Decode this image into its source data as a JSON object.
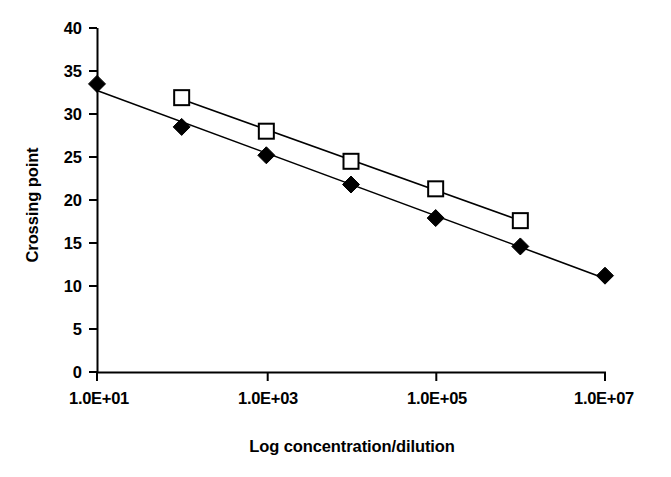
{
  "chart_data": {
    "type": "scatter",
    "title": "",
    "subtitle": "",
    "xlabel": "Log concentration/dilution",
    "ylabel": "Crossing point",
    "xscale": "log",
    "xlim": [
      10,
      10000000
    ],
    "ylim": [
      0,
      40
    ],
    "grid": false,
    "legend": "none",
    "x_tick_labels": [
      "1.0E+01",
      "1.0E+03",
      "1.0E+05",
      "1.0E+07"
    ],
    "x_tick_values": [
      10,
      1000,
      100000,
      10000000
    ],
    "y_tick_labels": [
      "0",
      "5",
      "10",
      "15",
      "20",
      "25",
      "30",
      "35",
      "40"
    ],
    "y_tick_values": [
      0,
      5,
      10,
      15,
      20,
      25,
      30,
      35,
      40
    ],
    "series": [
      {
        "name": "filled-diamond-series",
        "marker": "filled-diamond",
        "color": "#000000",
        "trendline": true,
        "x": [
          10,
          100,
          1000,
          10000,
          100000,
          1000000,
          10000000
        ],
        "x_log": [
          1,
          2,
          3,
          4,
          5,
          6,
          7
        ],
        "values": [
          33.5,
          28.5,
          25.2,
          21.8,
          17.9,
          14.6,
          11.2
        ]
      },
      {
        "name": "open-square-series",
        "marker": "open-square",
        "color": "#000000",
        "trendline": true,
        "x": [
          100,
          1000,
          10000,
          100000,
          1000000
        ],
        "x_log": [
          2,
          3,
          4,
          5,
          6
        ],
        "values": [
          31.9,
          28.0,
          24.5,
          21.3,
          17.6
        ]
      }
    ]
  },
  "colors": {
    "axis": "#000000",
    "text": "#000000",
    "background": "#ffffff",
    "series_1": "#000000",
    "series_2": "#000000"
  }
}
